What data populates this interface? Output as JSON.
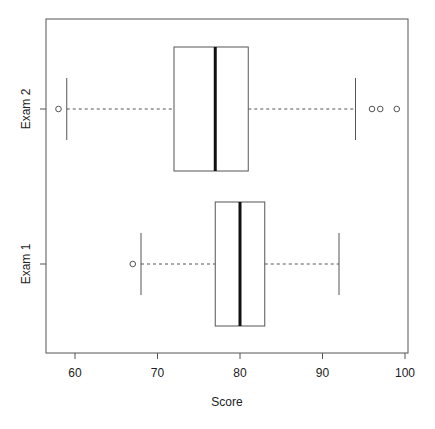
{
  "chart_data": {
    "type": "boxplot",
    "orientation": "horizontal",
    "title": "",
    "xlabel": "Score",
    "ylabel": "",
    "xlim": [
      56.3,
      100.4
    ],
    "x_ticks": [
      60,
      70,
      80,
      90,
      100
    ],
    "x_tick_labels": [
      "60",
      "70",
      "80",
      "90",
      "100"
    ],
    "grid": false,
    "legend": null,
    "categories": [
      "Exam 1",
      "Exam 2"
    ],
    "series": [
      {
        "name": "Exam 1",
        "whisker_low": 68,
        "q1": 77,
        "median": 80,
        "q3": 83,
        "whisker_high": 92,
        "outliers": [
          67
        ]
      },
      {
        "name": "Exam 2",
        "whisker_low": 59,
        "q1": 72,
        "median": 77,
        "q3": 81,
        "whisker_high": 94,
        "outliers": [
          58,
          96,
          97,
          99
        ]
      }
    ]
  },
  "colors": {
    "frame": "#555555",
    "box": "#555555",
    "median": "#111111",
    "text": "#222222"
  }
}
